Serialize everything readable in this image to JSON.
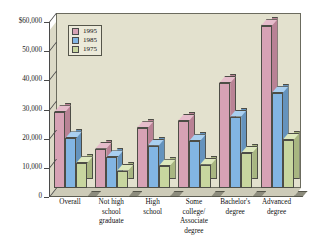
{
  "chart_data": {
    "type": "bar",
    "title": "",
    "subtitle": "",
    "xlabel": "",
    "ylabel": "",
    "ylim": [
      0,
      60000
    ],
    "grid": false,
    "legend_position": "top-left-inside",
    "orientation": "vertical-3d-grouped",
    "categories": [
      "Overall",
      "Not high school graduate",
      "High school",
      "Some college/ Associate degree",
      "Bachelor's degree",
      "Advanced degree"
    ],
    "category_lines": [
      [
        "Overall"
      ],
      [
        "Not high",
        "school",
        "graduate"
      ],
      [
        "High",
        "school"
      ],
      [
        "Some",
        "college/",
        "Associate",
        "degree"
      ],
      [
        "Bachelor's",
        "degree"
      ],
      [
        "Advanced",
        "degree"
      ]
    ],
    "series": [
      {
        "name": "1995",
        "color": "#d7a2b5",
        "values": [
          26000,
          13500,
          20500,
          23000,
          36000,
          55500
        ]
      },
      {
        "name": "1985",
        "color": "#82b5e3",
        "values": [
          17000,
          10500,
          14500,
          16000,
          24500,
          32500
        ]
      },
      {
        "name": "1975",
        "color": "#c8d69f",
        "values": [
          8500,
          6000,
          7500,
          8000,
          12000,
          16500
        ]
      }
    ],
    "yticks": [
      {
        "value": 60000,
        "label": "$60,000"
      },
      {
        "value": 50000,
        "label": "50,000"
      },
      {
        "value": 40000,
        "label": "40,000"
      },
      {
        "value": 30000,
        "label": "30,000"
      },
      {
        "value": 20000,
        "label": "20,000"
      },
      {
        "value": 10000,
        "label": "10,000"
      },
      {
        "value": 0,
        "label": "0"
      }
    ],
    "legend": [
      {
        "label": "1995",
        "color": "#d7a2b5"
      },
      {
        "label": "1985",
        "color": "#82b5e3"
      },
      {
        "label": "1975",
        "color": "#c8d69f"
      }
    ],
    "colors": {
      "plot_background": "#e3e1ce",
      "legend_background": "#eceada",
      "axis": "#4a4a4a",
      "text": "#111111",
      "series_1995": "#d7a2b5",
      "series_1985": "#82b5e3",
      "series_1975": "#c8d69f"
    }
  }
}
